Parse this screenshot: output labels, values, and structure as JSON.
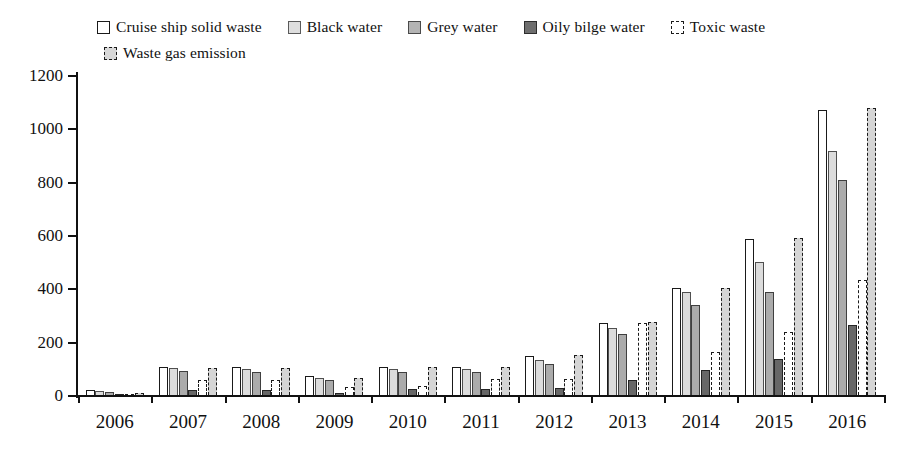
{
  "chart_data": {
    "type": "bar",
    "title": "",
    "xlabel": "",
    "ylabel": "",
    "ylim": [
      0,
      1200
    ],
    "ytick_labels": [
      "1200",
      "1000",
      "800",
      "600",
      "400",
      "200",
      "0"
    ],
    "yticks": [
      1200,
      1000,
      800,
      600,
      400,
      200,
      0
    ],
    "grid": false,
    "legend_position": "top",
    "categories": [
      "2006",
      "2007",
      "2008",
      "2009",
      "2010",
      "2011",
      "2012",
      "2013",
      "2014",
      "2015",
      "2016"
    ],
    "series": [
      {
        "name": "Cruise ship solid waste",
        "swatch": "sw-solid",
        "bar_class": "s0",
        "color": "#ffffff",
        "edge_color": "#1a1a1a",
        "values": [
          20,
          105,
          105,
          70,
          105,
          105,
          145,
          270,
          400,
          585,
          1070
        ]
      },
      {
        "name": "Black water",
        "swatch": "sw-light",
        "bar_class": "s1",
        "color": "#dcdcdc",
        "edge_color": "#4f4f4f",
        "values": [
          15,
          100,
          98,
          62,
          98,
          98,
          132,
          250,
          388,
          498,
          915
        ]
      },
      {
        "name": "Grey water",
        "swatch": "sw-mid",
        "bar_class": "s2",
        "color": "#ababab",
        "edge_color": "#3f3f3f",
        "values": [
          10,
          90,
          88,
          55,
          88,
          85,
          118,
          228,
          338,
          388,
          805
        ]
      },
      {
        "name": "Oily bilge water",
        "swatch": "sw-dark",
        "bar_class": "s3",
        "color": "#676767",
        "edge_color": "#242424",
        "values": [
          4,
          18,
          18,
          8,
          22,
          22,
          25,
          58,
          95,
          135,
          262
        ]
      },
      {
        "name": "Toxic waste",
        "swatch": "sw-dashwhite",
        "bar_class": "s4",
        "color": "#ffffff",
        "edge_color": "#1a1a1a",
        "values": [
          3,
          55,
          55,
          30,
          35,
          60,
          60,
          270,
          160,
          235,
          430
        ]
      },
      {
        "name": "Waste gas emission",
        "swatch": "sw-dashlight",
        "bar_class": "s5",
        "color": "#d5d5d5",
        "edge_color": "#1a1a1a",
        "values": [
          8,
          100,
          100,
          62,
          105,
          105,
          150,
          272,
          400,
          590,
          1075
        ]
      }
    ]
  },
  "legend": {
    "row1": [
      "Cruise ship solid waste",
      "Black water",
      "Grey water",
      "Oily bilge water",
      "Toxic waste"
    ],
    "row2": [
      "Waste gas emission"
    ]
  }
}
